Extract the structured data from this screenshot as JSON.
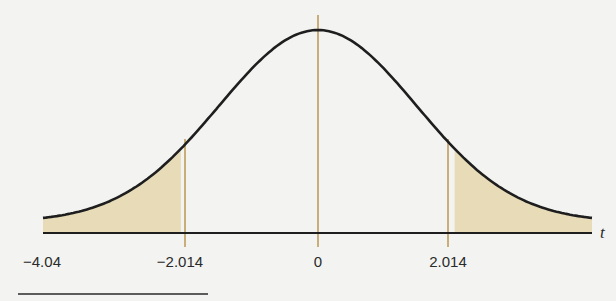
{
  "chart_data": {
    "type": "area",
    "title": "",
    "xlabel": "t",
    "ylabel": "",
    "grid": false,
    "legend": null,
    "xlim": [
      -4.04,
      4.04
    ],
    "tick_labels": [
      "−4.04",
      "−2.014",
      "0",
      "2.014"
    ],
    "ticks": [
      -4.04,
      -2.014,
      0,
      2.014
    ],
    "critical_values": [
      -2.014,
      2.014
    ],
    "center_line": 0,
    "shaded_regions": [
      {
        "from": -4.04,
        "to": -2.014,
        "label": "left tail"
      },
      {
        "from": 2.014,
        "to": 4.04,
        "label": "right tail"
      }
    ],
    "colors": {
      "curve": "#1e1e1e",
      "axis": "#1e1e1e",
      "shade": "#e8dcb8",
      "reference_lines": "#c9ae7a",
      "background": "#f3f4f2"
    }
  },
  "labels": {
    "axis_var": "t",
    "tick_0": "−4.04",
    "tick_1": "−2.014",
    "tick_2": "0",
    "tick_3": "2.014"
  }
}
